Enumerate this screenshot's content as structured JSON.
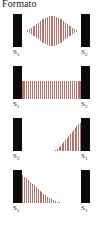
{
  "figure": {
    "title": "Formato",
    "background_color": "#ffffff",
    "bar_color": "#0b0b0b",
    "stripe_color": "#b5736b",
    "label_color": "#1c1c1c",
    "width": 105,
    "height": 237
  },
  "chart_data": {
    "type": "bar",
    "title": "Formato",
    "xlabel": "",
    "ylabel": "",
    "panels": [
      {
        "index": 1,
        "left_label": "S",
        "left_sub": "1",
        "right_label": "S",
        "right_sub": "2",
        "envelope": "diamond",
        "stripe_count": 23,
        "peak_position": 0.5,
        "values": [
          5,
          12,
          22,
          32,
          44,
          56,
          68,
          78,
          88,
          95,
          99,
          100,
          99,
          95,
          88,
          78,
          68,
          56,
          44,
          32,
          22,
          12,
          5
        ]
      },
      {
        "index": 2,
        "left_label": "S",
        "left_sub": "1",
        "right_label": "S",
        "right_sub": "2",
        "envelope": "uniform",
        "stripe_count": 30,
        "peak_position": 0.5,
        "values": [
          100,
          100,
          100,
          100,
          100,
          100,
          100,
          100,
          100,
          100,
          100,
          100,
          100,
          100,
          100,
          100,
          100,
          100,
          100,
          100,
          100,
          100,
          100,
          100,
          100,
          100,
          100,
          100,
          100,
          100
        ]
      },
      {
        "index": 3,
        "left_label": "S",
        "left_sub": "2",
        "right_label": "S",
        "right_sub": "1",
        "envelope": "ramp-up",
        "stripe_count": 16,
        "peak_position": 1.0,
        "values": [
          4,
          8,
          13,
          19,
          25,
          31,
          38,
          45,
          52,
          60,
          67,
          75,
          82,
          89,
          95,
          100
        ]
      },
      {
        "index": 4,
        "left_label": "S",
        "left_sub": "2",
        "right_label": "S",
        "right_sub": "1",
        "envelope": "ramp-down",
        "stripe_count": 20,
        "peak_position": 0.0,
        "values": [
          100,
          94,
          88,
          81,
          75,
          69,
          63,
          56,
          50,
          44,
          38,
          33,
          28,
          23,
          19,
          15,
          11,
          8,
          5,
          3
        ]
      }
    ]
  }
}
